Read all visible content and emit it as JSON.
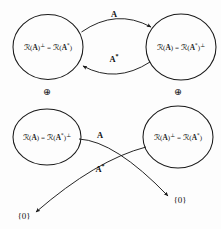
{
  "figure": {
    "background_color": "#fdfdfd",
    "stroke_color": "#1a1a1a"
  },
  "top_row": {
    "left_circle": {
      "name": "null-space-perp-circle",
      "label_html": "<span class=\"cal\">&#8475;</span>(<span class=\"op\">A</span>)<sup>&#8869;</sup> = <span class=\"cal\">&#8475;</span>(<span class=\"op\">A</span><sup>*</sup>)",
      "label_plain": "N(A)⊥ = R(A*)",
      "cx": 48,
      "cy": 47,
      "rx": 35,
      "ry": 32
    },
    "right_circle": {
      "name": "range-circle",
      "label_html": "<span class=\"cal\">&#8475;</span>(<span class=\"op\">A</span>) = <span class=\"cal\">&#8475;</span>(<span class=\"op\">A</span><sup>*</sup>)<sup>&#8869;</sup>",
      "label_plain": "R(A) = N(A*)⊥",
      "cx": 181,
      "cy": 47,
      "rx": 35,
      "ry": 33
    },
    "forward_arrow": {
      "name": "forward-map-arrow",
      "label_html": "A",
      "label_plain": "A"
    },
    "adjoint_arrow": {
      "name": "adjoint-map-arrow",
      "label_html": "A<sup>*</sup>",
      "label_plain": "A*"
    },
    "left_sum_symbol": "⊕",
    "right_sum_symbol": "⊕"
  },
  "bottom_row": {
    "left_circle": {
      "name": "null-space-circle",
      "label_html": "<span class=\"cal\">&#8475;</span>(<span class=\"op\">A</span>) = <span class=\"cal\">&#8475;</span>(<span class=\"op\">A</span><sup>*</sup>)<sup>&#8869;</sup>",
      "label_plain": "N(A) = R(A*)⊥",
      "cx": 47,
      "cy": 137,
      "rx": 34,
      "ry": 28
    },
    "right_circle": {
      "name": "range-perp-circle",
      "label_html": "<span class=\"cal\">&#8475;</span>(<span class=\"op\">A</span>)<sup>&#8869;</sup> = <span class=\"cal\">&#8475;</span>(<span class=\"op\">A</span><sup>*</sup>)",
      "label_plain": "R(A)⊥ = N(A*)",
      "cx": 178,
      "cy": 137,
      "rx": 35,
      "ry": 31
    },
    "forward_arrow": {
      "name": "forward-kernel-arrow",
      "label_html": "A",
      "label_plain": "A"
    },
    "adjoint_arrow": {
      "name": "adjoint-kernel-arrow",
      "label_html": "A<sup>*</sup>",
      "label_plain": "A*"
    },
    "right_zero": {
      "name": "zero-vector-right",
      "label": "{0}"
    },
    "left_zero": {
      "name": "zero-vector-left",
      "label": "{0}"
    }
  }
}
